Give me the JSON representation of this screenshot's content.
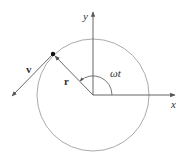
{
  "diagram": {
    "labels": {
      "x_axis": "x",
      "y_axis": "y",
      "position_vector": "r",
      "velocity_vector": "v",
      "angle": "ωt"
    },
    "colors": {
      "circle": "#a0a0a0",
      "axes": "#555555",
      "vectors": "#555555",
      "point": "#111111",
      "background": "#ffffff"
    }
  }
}
